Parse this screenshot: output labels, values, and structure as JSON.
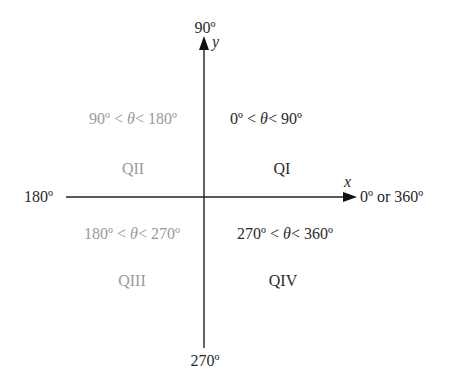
{
  "diagram": {
    "axes": {
      "y_axis": {
        "name": "y",
        "top_label": "90º",
        "bottom_label": "270º"
      },
      "x_axis": {
        "name": "x",
        "left_label": "180º",
        "right_label": "0º or 360º"
      }
    },
    "quadrants": [
      {
        "id": "QI",
        "label": "QI",
        "range_lo": "0º",
        "range_hi": "90º",
        "theta": "θ",
        "lt": "<",
        "color": "#2a2a2a"
      },
      {
        "id": "QII",
        "label": "QII",
        "range_lo": "90º",
        "range_hi": "180º",
        "theta": "θ",
        "lt": "<",
        "color": "#9a9a9a"
      },
      {
        "id": "QIII",
        "label": "QIII",
        "range_lo": "180º",
        "range_hi": "270º",
        "theta": "θ",
        "lt": "<",
        "color": "#9a9a9a"
      },
      {
        "id": "QIV",
        "label": "QIV",
        "range_lo": "270º",
        "range_hi": "360º",
        "theta": "θ",
        "lt": "<",
        "color": "#2a2a2a"
      }
    ],
    "colors": {
      "axis": "#222222",
      "active_text": "#2a2a2a",
      "muted_text": "#9a9a9a"
    }
  }
}
